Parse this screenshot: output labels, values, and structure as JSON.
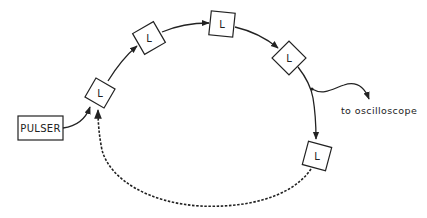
{
  "diagram": {
    "type": "ring-delay-line",
    "colors": {
      "stroke": "#222222",
      "background": "#ffffff"
    },
    "pulser": {
      "label": "PULSER"
    },
    "elements": [
      {
        "id": "L1",
        "label": "L"
      },
      {
        "id": "L2",
        "label": "L"
      },
      {
        "id": "L3",
        "label": "L"
      },
      {
        "id": "L4",
        "label": "L"
      },
      {
        "id": "L5",
        "label": "L"
      }
    ],
    "output": {
      "label": "to oscilloscope"
    },
    "connections": [
      {
        "from": "PULSER",
        "to": "L1",
        "style": "solid-arrow"
      },
      {
        "from": "L1",
        "to": "L2",
        "style": "solid-arrow"
      },
      {
        "from": "L2",
        "to": "L3",
        "style": "solid-arrow"
      },
      {
        "from": "L3",
        "to": "L4",
        "style": "solid-arrow"
      },
      {
        "from": "L4",
        "to": "L5",
        "style": "solid-arrow",
        "tap": "to oscilloscope"
      },
      {
        "from": "L5",
        "to": "L1",
        "style": "dashed-arrow"
      }
    ]
  }
}
